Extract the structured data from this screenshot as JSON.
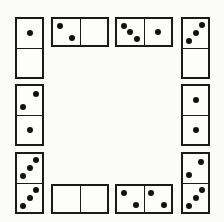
{
  "dominoes": [
    {
      "id": "d1",
      "orientation": "v",
      "x": 15,
      "y": 17,
      "values": [
        1,
        0
      ]
    },
    {
      "id": "d2",
      "orientation": "h",
      "x": 51,
      "y": 17,
      "values": [
        2,
        0
      ]
    },
    {
      "id": "d3",
      "orientation": "h",
      "x": 115,
      "y": 17,
      "values": [
        3,
        1
      ]
    },
    {
      "id": "d4",
      "orientation": "v",
      "x": 181,
      "y": 17,
      "values": [
        3,
        0
      ]
    },
    {
      "id": "d5",
      "orientation": "v",
      "x": 15,
      "y": 84,
      "values": [
        2,
        1
      ]
    },
    {
      "id": "d6",
      "orientation": "v",
      "x": 181,
      "y": 84,
      "values": [
        1,
        1
      ]
    },
    {
      "id": "d7",
      "orientation": "v",
      "x": 15,
      "y": 152,
      "values": [
        3,
        3
      ]
    },
    {
      "id": "d8",
      "orientation": "h",
      "x": 51,
      "y": 184,
      "values": [
        0,
        0
      ]
    },
    {
      "id": "d9",
      "orientation": "h",
      "x": 115,
      "y": 184,
      "values": [
        2,
        2
      ]
    },
    {
      "id": "d10",
      "orientation": "v",
      "x": 181,
      "y": 152,
      "values": [
        2,
        3
      ]
    }
  ],
  "pip_layouts": {
    "0": [],
    "1": [
      [
        50,
        50
      ]
    ],
    "2": [
      [
        25,
        27
      ],
      [
        72,
        72
      ]
    ],
    "3": [
      [
        75,
        22
      ],
      [
        50,
        50
      ],
      [
        25,
        78
      ]
    ],
    "2v": [
      [
        72,
        27
      ],
      [
        25,
        72
      ]
    ]
  }
}
